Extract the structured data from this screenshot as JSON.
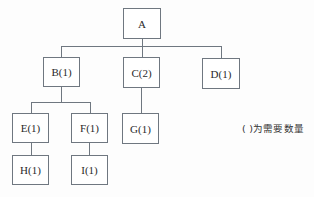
{
  "diagram": {
    "type": "tree",
    "nodes": {
      "A": {
        "label": "A"
      },
      "B": {
        "label": "B(1)"
      },
      "C": {
        "label": "C(2)"
      },
      "D": {
        "label": "D(1)"
      },
      "E": {
        "label": "E(1)"
      },
      "F": {
        "label": "F(1)"
      },
      "G": {
        "label": "G(1)"
      },
      "H": {
        "label": "H(1)"
      },
      "I": {
        "label": "I(1)"
      }
    },
    "edges": [
      [
        "A",
        "B"
      ],
      [
        "A",
        "C"
      ],
      [
        "A",
        "D"
      ],
      [
        "B",
        "E"
      ],
      [
        "B",
        "F"
      ],
      [
        "C",
        "G"
      ],
      [
        "E",
        "H"
      ],
      [
        "F",
        "I"
      ]
    ],
    "note": "( )为需要数量",
    "colors": {
      "line": "#6f7780",
      "background": "#ffffff",
      "text": "#2a2a2a"
    }
  }
}
